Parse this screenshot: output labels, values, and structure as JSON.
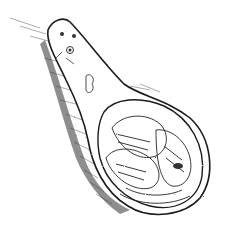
{
  "image": {
    "subject": "ink drawing of a spoon-shaped object with carved floral bowl",
    "colors": {
      "background": "#ffffff",
      "ink": "#1a1a1a",
      "shade": "#555555"
    }
  }
}
